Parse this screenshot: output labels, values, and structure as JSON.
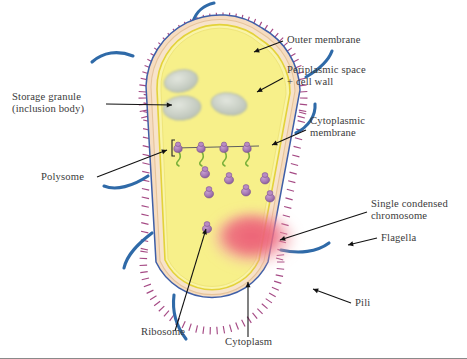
{
  "figure": {
    "background_color": "#ffffff",
    "colors": {
      "cytoplasm": "#f7f08a",
      "cell_wall_band": "#f6dcc0",
      "outer_membrane_line": "#3f5fa8",
      "cytoplasmic_membrane_line": "#e3d23a",
      "pili": "#a0407e",
      "flagella": "#2f6aa8",
      "ribosome": "#a97cb4",
      "nascent_chain": "#7ab03a",
      "nucleoid": "#e8607a",
      "storage_granule": "#c9cfc2",
      "label_text": "#3a3a3a",
      "leader_line": "#111111"
    }
  },
  "labels": [
    {
      "id": "outer-membrane",
      "text": "Outer membrane",
      "align": "left",
      "x": 287,
      "y": 34,
      "leader": {
        "x1": 283,
        "y1": 41,
        "x2": 254,
        "y2": 52
      }
    },
    {
      "id": "periplasmic-space",
      "text": "Periplasmic space\n+ cell wall",
      "align": "left",
      "x": 287,
      "y": 64,
      "leader": {
        "x1": 283,
        "y1": 78,
        "x2": 257,
        "y2": 92
      }
    },
    {
      "id": "cytoplasmic-membrane",
      "text": "Cytoplasmic\nmembrane",
      "align": "left",
      "x": 310,
      "y": 115,
      "leader": {
        "x1": 306,
        "y1": 130,
        "x2": 272,
        "y2": 145
      }
    },
    {
      "id": "single-condensed-chromosome",
      "text": "Single condensed\nchromosome",
      "align": "left",
      "x": 371,
      "y": 198,
      "leader": {
        "x1": 367,
        "y1": 212,
        "x2": 280,
        "y2": 240
      }
    },
    {
      "id": "flagella",
      "text": "Flagella",
      "align": "left",
      "x": 381,
      "y": 232,
      "leader": {
        "x1": 377,
        "y1": 238,
        "x2": 348,
        "y2": 245
      }
    },
    {
      "id": "pili",
      "text": "Pili",
      "align": "left",
      "x": 355,
      "y": 303,
      "leader": {
        "x1": 351,
        "y1": 303,
        "x2": 313,
        "y2": 289
      }
    },
    {
      "id": "storage-granule",
      "text": "Storage granule\n(inclusion body)",
      "align": "left",
      "x": 12,
      "y": 91,
      "leader": {
        "x1": 106,
        "y1": 104,
        "x2": 172,
        "y2": 105
      }
    },
    {
      "id": "polysome",
      "text": "Polysome",
      "align": "left",
      "x": 41,
      "y": 174,
      "leader": {
        "x1": 97,
        "y1": 177,
        "x2": 167,
        "y2": 150
      }
    },
    {
      "id": "ribosome",
      "text": "Ribosome",
      "align": "left",
      "x": 141,
      "y": 333,
      "leader": {
        "x1": 175,
        "y1": 331,
        "x2": 206,
        "y2": 229
      }
    },
    {
      "id": "cytoplasm",
      "text": "Cytoplasm",
      "align": "left",
      "x": 225,
      "y": 341,
      "leader": {
        "x1": 248,
        "y1": 337,
        "x2": 248,
        "y2": 282
      }
    }
  ],
  "structures": {
    "storage_granules": [
      {
        "cx": 181,
        "cy": 81,
        "rx": 17,
        "ry": 11,
        "rot": -12
      },
      {
        "cx": 229,
        "cy": 104,
        "rx": 18,
        "ry": 11,
        "rot": 8
      },
      {
        "cx": 182,
        "cy": 108,
        "rx": 19,
        "ry": 12,
        "rot": -6
      }
    ],
    "polysome": {
      "ribosome_count": 4,
      "strand_y": 148,
      "x_start": 178,
      "x_spacing": 23,
      "bracket_x": 172
    },
    "free_ribosomes": [
      {
        "cx": 205,
        "cy": 172
      },
      {
        "cx": 229,
        "cy": 178
      },
      {
        "cx": 209,
        "cy": 192
      },
      {
        "cx": 246,
        "cy": 190
      },
      {
        "cx": 265,
        "cy": 178
      },
      {
        "cx": 270,
        "cy": 196
      },
      {
        "cx": 207,
        "cy": 227
      }
    ],
    "nucleoid": {
      "cx": 253,
      "cy": 239,
      "rx": 41,
      "ry": 27
    },
    "flagella_count": 6,
    "pili_count": 84
  }
}
